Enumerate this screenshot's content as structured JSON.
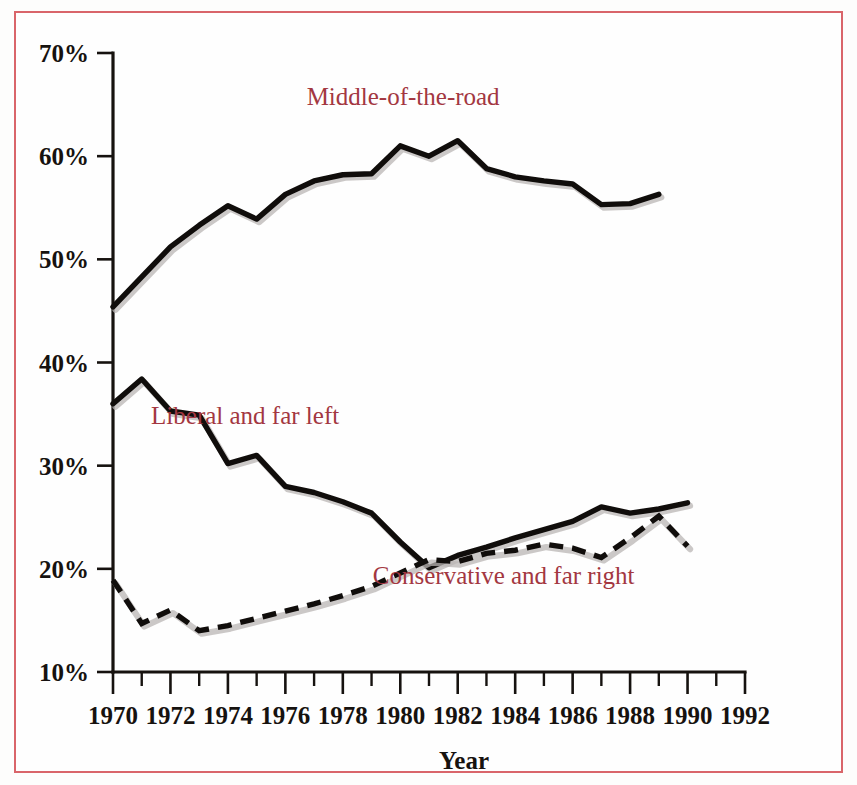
{
  "figure": {
    "border_color": "#d9656a",
    "background": "#fefefe"
  },
  "chart_data": {
    "type": "line",
    "title": "",
    "xlabel": "Year",
    "ylabel": "",
    "xlim": [
      1970,
      1992
    ],
    "ylim": [
      10,
      70
    ],
    "grid": false,
    "legend_position": "inline-annotations",
    "x_tick_labels": [
      "1970",
      "1972",
      "1974",
      "1976",
      "1978",
      "1980",
      "1982",
      "1984",
      "1986",
      "1988",
      "1990",
      "1992"
    ],
    "x_ticks": [
      1970,
      1972,
      1974,
      1976,
      1978,
      1980,
      1982,
      1984,
      1986,
      1988,
      1990,
      1992
    ],
    "x_minor_ticks": [
      1971,
      1973,
      1975,
      1977,
      1979,
      1981,
      1983,
      1985,
      1987,
      1989,
      1991
    ],
    "y_tick_labels": [
      "70%",
      "60%",
      "50%",
      "40%",
      "30%",
      "20%",
      "10%"
    ],
    "y_ticks": [
      70,
      60,
      50,
      40,
      30,
      20,
      10
    ],
    "x": [
      1970,
      1971,
      1972,
      1973,
      1974,
      1975,
      1976,
      1977,
      1978,
      1979,
      1980,
      1981,
      1982,
      1983,
      1984,
      1985,
      1986,
      1987,
      1988,
      1989,
      1990
    ],
    "series": [
      {
        "name": "Middle-of-the-road",
        "style": "solid",
        "color": "#100d0b",
        "label_color": "#a33741",
        "values": [
          45.4,
          48.3,
          51.2,
          53.3,
          55.2,
          53.9,
          56.3,
          57.6,
          58.2,
          58.3,
          61.0,
          60.0,
          61.5,
          58.8,
          58.0,
          57.6,
          57.3,
          55.3,
          55.4,
          56.3,
          null
        ]
      },
      {
        "name": "Liberal and far left",
        "style": "solid",
        "color": "#100d0b",
        "label_color": "#a33741",
        "values": [
          36.0,
          38.4,
          35.3,
          34.9,
          30.2,
          31.0,
          28.0,
          27.4,
          26.5,
          25.4,
          22.6,
          20.1,
          21.3,
          22.1,
          23.0,
          23.8,
          24.6,
          26.0,
          25.4,
          25.8,
          26.4
        ]
      },
      {
        "name": "Conservative and far right",
        "style": "dashed",
        "color": "#100d0b",
        "label_color": "#a33741",
        "values": [
          18.9,
          14.7,
          16.0,
          14.0,
          14.5,
          15.2,
          15.9,
          16.6,
          17.4,
          18.3,
          19.6,
          20.9,
          20.7,
          21.5,
          21.8,
          22.4,
          22.0,
          21.1,
          23.0,
          25.1,
          22.2
        ]
      }
    ],
    "annotations": [
      {
        "text": "Middle-of-the-road",
        "x": 1980.1,
        "y": 65.0
      },
      {
        "text": "Liberal and far left",
        "x": 1974.6,
        "y": 34.0
      },
      {
        "text": "Conservative and far right",
        "x": 1983.6,
        "y": 18.5
      }
    ]
  }
}
